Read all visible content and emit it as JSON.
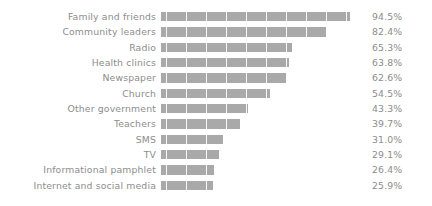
{
  "chart_data": {
    "type": "bar",
    "orientation": "horizontal",
    "title": "",
    "subtitle": "",
    "xlabel": "",
    "ylabel": "",
    "xlim": [
      0,
      100
    ],
    "grid": "vertical",
    "gridline_interval": 10,
    "legend": "none",
    "value_label_suffix": "%",
    "categories": [
      "Family and friends",
      "Community leaders",
      "Radio",
      "Health clinics",
      "Newspaper",
      "Church",
      "Other government",
      "Teachers",
      "SMS",
      "TV",
      "Informational pamphlet",
      "Internet and social media"
    ],
    "values": [
      94.5,
      82.4,
      65.3,
      63.8,
      62.6,
      54.5,
      43.3,
      39.7,
      31.0,
      29.1,
      26.4,
      25.9
    ],
    "value_labels": [
      "94.5%",
      "82.4%",
      "65.3%",
      "63.8%",
      "62.6%",
      "54.5%",
      "43.3%",
      "39.7%",
      "31.0%",
      "29.1%",
      "26.4%",
      "25.9%"
    ],
    "colors": {
      "bar": "#a9a9a9",
      "text": "#8d8d8d",
      "gridline": "#ededed",
      "gridline_over_bar": "#ffffff",
      "background": "#ffffff"
    }
  }
}
